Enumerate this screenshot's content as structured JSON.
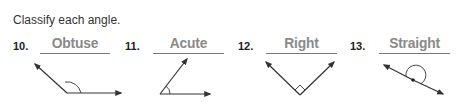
{
  "instruction": "Classify each angle.",
  "problems": [
    {
      "number": "10.",
      "answer": "Obtuse",
      "angle_type": "obtuse"
    },
    {
      "number": "11.",
      "answer": "Acute",
      "angle_type": "acute"
    },
    {
      "number": "12.",
      "answer": "Right",
      "angle_type": "right"
    },
    {
      "number": "13.",
      "answer": "Straight",
      "angle_type": "straight"
    }
  ],
  "colors": {
    "answer_text": "#8a8a8a",
    "label_text": "#222222",
    "lines": "#333333"
  }
}
